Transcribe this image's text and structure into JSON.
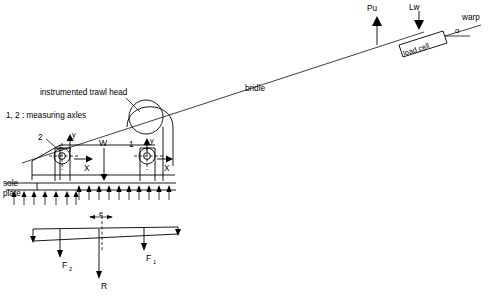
{
  "figure": {
    "type": "engineering-schematic",
    "background_color": "#ffffff",
    "line_color": "#000000"
  },
  "labels": {
    "instrumented_trawl_head": "instrumented trawl head",
    "measuring_axles": "1, 2 : measuring axles",
    "axle_2": "2",
    "axle_1": "1",
    "axis_y_left": "y",
    "axis_x_left": "X",
    "axis_y_right": "y",
    "axis_x_right": "X",
    "weight": "W",
    "sole": "sole",
    "plate": "plate",
    "bridle": "bridle",
    "pu": "Pu",
    "lw": "Lw",
    "warp": "warp",
    "alpha": "α",
    "load_cell": "load cell",
    "eccentricity": "e",
    "force_f2": "F",
    "force_f2_sub": "2",
    "force_f1": "F",
    "force_f1_sub": "1",
    "reaction_r": "R"
  },
  "annotations": {
    "upward_pressure_arrow_count_left": 7,
    "upward_pressure_arrow_count_right": 11,
    "warp_angle_symbol": "α"
  }
}
